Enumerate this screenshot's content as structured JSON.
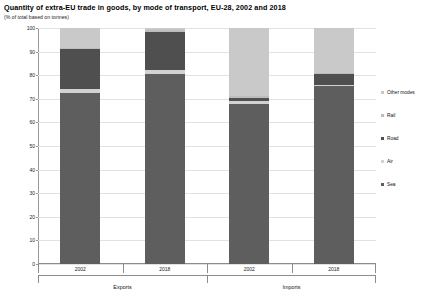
{
  "header": {
    "title": "Quantity of extra-EU trade in goods, by mode of transport, EU-28, 2002 and 2018",
    "subtitle": "(% of total  based on tonnes)"
  },
  "legend": {
    "position": "right",
    "items": [
      {
        "label": "Other modes",
        "color": "#c9c9c9"
      },
      {
        "label": "Rail",
        "color": "#bdbdbd"
      },
      {
        "label": "Road",
        "color": "#4f4f4f"
      },
      {
        "label": "Air",
        "color": "#d2d2d2"
      },
      {
        "label": "Sea",
        "color": "#5e5e5e"
      }
    ]
  },
  "axis": {
    "y_ticks": [
      "100",
      "90",
      "80",
      "70",
      "60",
      "50",
      "40",
      "30",
      "20",
      "10",
      "0"
    ],
    "y_min": 0,
    "y_max": 100
  },
  "groups": [
    {
      "label": "Exports",
      "years": [
        "2002",
        "2018"
      ]
    },
    {
      "label": "Imports",
      "years": [
        "2002",
        "2018"
      ]
    }
  ],
  "chart_data": {
    "type": "bar",
    "subtype": "stacked-column-100",
    "title": "Quantity of extra-EU trade in goods, by mode of transport, EU-28, 2002 and 2018",
    "subtitle": "(% of total  based on tonnes)",
    "xlabel": "",
    "ylabel": "",
    "ylim": [
      0,
      100
    ],
    "grid": true,
    "legend_position": "right",
    "categories": [
      "Exports 2002",
      "Exports 2018",
      "Imports 2002",
      "Imports 2018"
    ],
    "category_years": [
      "2002",
      "2018",
      "2002",
      "2018"
    ],
    "category_groups": [
      "Exports",
      "Exports",
      "Imports",
      "Imports"
    ],
    "series": [
      {
        "name": "Sea",
        "color": "#5e5e5e",
        "values": [
          72.5,
          80.5,
          68.0,
          75.5
        ]
      },
      {
        "name": "Air",
        "color": "#d2d2d2",
        "values": [
          1.5,
          1.5,
          1.0,
          0.5
        ]
      },
      {
        "name": "Road",
        "color": "#4f4f4f",
        "values": [
          17.0,
          16.5,
          1.5,
          4.5
        ]
      },
      {
        "name": "Rail",
        "color": "#bdbdbd",
        "values": [
          0.5,
          0.5,
          0.5,
          0.5
        ]
      },
      {
        "name": "Other modes",
        "color": "#c9c9c9",
        "values": [
          8.5,
          1.0,
          29.0,
          19.0
        ]
      }
    ]
  }
}
